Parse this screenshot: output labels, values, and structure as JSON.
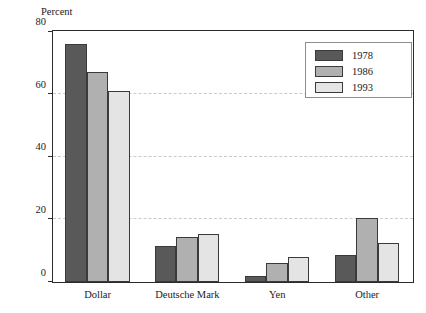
{
  "chart_data": {
    "type": "bar",
    "title": "",
    "subtitle": "",
    "xlabel": "",
    "ylabel": "Percent",
    "ylim": [
      0,
      80
    ],
    "yticks": [
      0,
      20,
      40,
      60,
      80
    ],
    "grid": "horizontal-dashed",
    "legend_position": "top-right",
    "categories": [
      "Dollar",
      "Deutsche Mark",
      "Yen",
      "Other"
    ],
    "series": [
      {
        "name": "1978",
        "color": "#595959",
        "values": [
          76,
          11.5,
          2,
          8.5
        ]
      },
      {
        "name": "1986",
        "color": "#b0b0b0",
        "values": [
          67,
          14.5,
          6,
          20.5
        ]
      },
      {
        "name": "1993",
        "color": "#e4e4e4",
        "values": [
          61,
          15.5,
          8,
          12.5
        ]
      }
    ]
  },
  "axis": {
    "y_title": "Percent",
    "tick_labels": [
      "0",
      "20",
      "40",
      "60",
      "80"
    ]
  },
  "legend": {
    "entries": [
      {
        "label": "1978"
      },
      {
        "label": "1986"
      },
      {
        "label": "1993"
      }
    ]
  }
}
